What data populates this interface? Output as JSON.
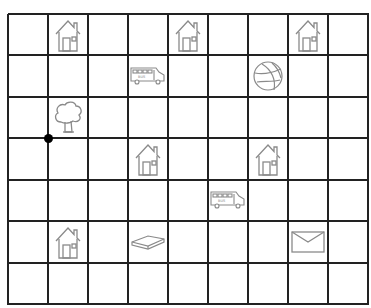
{
  "grid": {
    "columns": 9,
    "rows": 7,
    "line_color": "#222222",
    "icon_color": "#8a8a8a"
  },
  "items": [
    {
      "type": "house",
      "col": 1,
      "row": 0
    },
    {
      "type": "house",
      "col": 4,
      "row": 0
    },
    {
      "type": "house",
      "col": 7,
      "row": 0
    },
    {
      "type": "bus",
      "col": 3,
      "row": 1
    },
    {
      "type": "basketball",
      "col": 6,
      "row": 1
    },
    {
      "type": "tree",
      "col": 1,
      "row": 2
    },
    {
      "type": "house",
      "col": 3,
      "row": 3
    },
    {
      "type": "house",
      "col": 6,
      "row": 3
    },
    {
      "type": "bus",
      "col": 5,
      "row": 4
    },
    {
      "type": "house",
      "col": 1,
      "row": 5
    },
    {
      "type": "book",
      "col": 3,
      "row": 5
    },
    {
      "type": "envelope",
      "col": 7,
      "row": 5
    }
  ],
  "marker": {
    "type": "dot",
    "col_line": 1,
    "row_line": 3,
    "color": "#000000"
  }
}
